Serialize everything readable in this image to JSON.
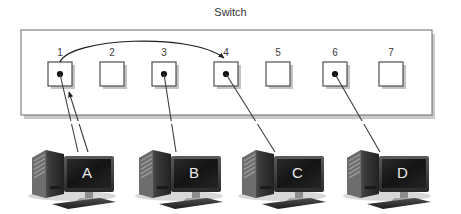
{
  "diagram": {
    "title": "Switch",
    "type": "network-switch-frame-forwarding"
  },
  "switch": {
    "label": "Switch",
    "box": {
      "x": 21,
      "y": 30,
      "w": 411,
      "h": 85
    },
    "ports": [
      {
        "number": "1",
        "x": 48,
        "y": 62,
        "occupied": true
      },
      {
        "number": "2",
        "x": 100,
        "y": 62,
        "occupied": false
      },
      {
        "number": "3",
        "x": 152,
        "y": 62,
        "occupied": true
      },
      {
        "number": "4",
        "x": 214,
        "y": 62,
        "occupied": true
      },
      {
        "number": "5",
        "x": 266,
        "y": 62,
        "occupied": false
      },
      {
        "number": "6",
        "x": 323,
        "y": 62,
        "occupied": true
      },
      {
        "number": "7",
        "x": 379,
        "y": 62,
        "occupied": false
      }
    ],
    "port_size": 24
  },
  "forwarding_arrow": {
    "from_port": "1",
    "to_port": "4",
    "description": "curved arrow from port 1 to port 4"
  },
  "ingress_arrow": {
    "at_port": "1",
    "direction": "up",
    "description": "frame entering switch from computer A"
  },
  "computers": [
    {
      "id": "A",
      "letter": "A",
      "x": 30,
      "y": 128,
      "port": "1"
    },
    {
      "id": "B",
      "letter": "B",
      "x": 137,
      "y": 128,
      "port": "3"
    },
    {
      "id": "C",
      "letter": "C",
      "x": 240,
      "y": 128,
      "port": "4"
    },
    {
      "id": "D",
      "letter": "D",
      "x": 345,
      "y": 128,
      "port": "6"
    }
  ],
  "cables": [
    {
      "from": "port-1",
      "to": "computer-A"
    },
    {
      "from": "computer-A",
      "to": "port-1-ingress"
    },
    {
      "from": "port-3",
      "to": "computer-B"
    },
    {
      "from": "port-4",
      "to": "computer-C"
    },
    {
      "from": "port-6",
      "to": "computer-D"
    }
  ],
  "colors": {
    "background": "#ffffff",
    "outline": "#555555",
    "port_fill": "#ffffff",
    "dot": "#111111",
    "cable": "#444444",
    "shadow": "#b8b8b8",
    "pc_dark": "#2e2e2e",
    "pc_mid": "#555555",
    "screen": "#1b1b1b",
    "letter": "#e9e9e9"
  }
}
